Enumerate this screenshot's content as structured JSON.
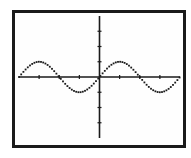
{
  "calculator_graph": {
    "function": "y = sin(x)",
    "window": {
      "xmin": -6.283,
      "xmax": 6.283,
      "xscl": 1.5708,
      "ymin": -4,
      "ymax": 4,
      "yscl": 1
    },
    "colors": {
      "frame": "#1a1a1a",
      "screen_bg": "#fefefe",
      "axes": "#1a1a1a",
      "plot": "#1a1a1a"
    }
  },
  "chart_data": {
    "type": "line",
    "title": "",
    "xlabel": "",
    "ylabel": "",
    "xlim": [
      -6.283,
      6.283
    ],
    "ylim": [
      -4,
      4
    ],
    "grid": false,
    "series": [
      {
        "name": "sin(x)",
        "x": [
          -6.283,
          -5.498,
          -4.712,
          -3.927,
          -3.142,
          -2.356,
          -1.571,
          -0.785,
          0,
          0.785,
          1.571,
          2.356,
          3.142,
          3.927,
          4.712,
          5.498,
          6.283
        ],
        "values": [
          0,
          0.707,
          1,
          0.707,
          0,
          -0.707,
          -1,
          -0.707,
          0,
          0.707,
          1,
          0.707,
          0,
          -0.707,
          -1,
          -0.707,
          0
        ]
      }
    ]
  }
}
